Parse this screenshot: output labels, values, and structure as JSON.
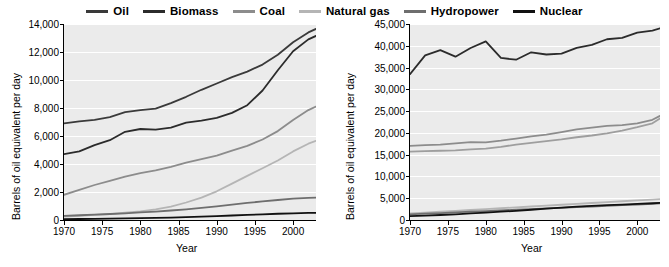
{
  "legend": {
    "items": [
      {
        "label": "Oil",
        "color": "#3a3a3a"
      },
      {
        "label": "Biomass",
        "color": "#2b2b2b"
      },
      {
        "label": "Coal",
        "color": "#8c8c8c"
      },
      {
        "label": "Natural gas",
        "color": "#b5b5b5"
      },
      {
        "label": "Hydropower",
        "color": "#6e6e6e"
      },
      {
        "label": "Nuclear",
        "color": "#111111"
      }
    ]
  },
  "chart_data": [
    {
      "type": "line",
      "title": "",
      "xlabel": "Year",
      "ylabel": "Barrels of oil equivalent per day",
      "xlim": [
        1970,
        2003
      ],
      "ylim": [
        0,
        14000
      ],
      "xticks": [
        1970,
        1975,
        1980,
        1985,
        1990,
        1995,
        2000
      ],
      "yticks": [
        0,
        2000,
        4000,
        6000,
        8000,
        10000,
        12000,
        14000
      ],
      "ytick_labels": [
        "0",
        "2,000",
        "4,000",
        "6,000",
        "8,000",
        "10,000",
        "12,000",
        "14,000"
      ],
      "grid": true,
      "legend_position": "top",
      "x": [
        1970,
        1972,
        1974,
        1976,
        1978,
        1980,
        1982,
        1984,
        1986,
        1988,
        1990,
        1992,
        1994,
        1996,
        1998,
        2000,
        2002,
        2003
      ],
      "series": [
        {
          "name": "Oil",
          "color": "#3a3a3a",
          "values": [
            6900,
            7050,
            7150,
            7350,
            7700,
            7850,
            7950,
            8350,
            8800,
            9300,
            9750,
            10200,
            10600,
            11100,
            11800,
            12700,
            13400,
            13650
          ]
        },
        {
          "name": "Biomass",
          "color": "#2b2b2b",
          "values": [
            4700,
            4900,
            5350,
            5700,
            6300,
            6500,
            6450,
            6600,
            6950,
            7100,
            7300,
            7650,
            8200,
            9250,
            10700,
            12050,
            12900,
            13150
          ]
        },
        {
          "name": "Coal",
          "color": "#8c8c8c",
          "values": [
            1800,
            2150,
            2500,
            2800,
            3100,
            3350,
            3550,
            3800,
            4100,
            4350,
            4600,
            4950,
            5300,
            5750,
            6350,
            7150,
            7850,
            8100
          ]
        },
        {
          "name": "Natural gas",
          "color": "#b5b5b5",
          "values": [
            250,
            300,
            360,
            420,
            520,
            620,
            760,
            950,
            1250,
            1600,
            2050,
            2600,
            3150,
            3700,
            4250,
            4900,
            5450,
            5650
          ]
        },
        {
          "name": "Hydropower",
          "color": "#6e6e6e",
          "values": [
            300,
            340,
            380,
            430,
            480,
            540,
            600,
            680,
            760,
            860,
            980,
            1100,
            1220,
            1330,
            1430,
            1520,
            1580,
            1600
          ]
        },
        {
          "name": "Nuclear",
          "color": "#111111",
          "values": [
            60,
            70,
            80,
            95,
            110,
            130,
            150,
            175,
            205,
            240,
            280,
            320,
            365,
            405,
            445,
            480,
            505,
            515
          ]
        }
      ]
    },
    {
      "type": "line",
      "title": "",
      "xlabel": "Year",
      "ylabel": "Barrels of oil equivalent per day",
      "xlim": [
        1970,
        2003
      ],
      "ylim": [
        0,
        45000
      ],
      "xticks": [
        1970,
        1975,
        1980,
        1985,
        1990,
        1995,
        2000
      ],
      "yticks": [
        0,
        5000,
        10000,
        15000,
        20000,
        25000,
        30000,
        35000,
        40000,
        45000
      ],
      "ytick_labels": [
        "0",
        "5,000",
        "10,000",
        "15,000",
        "20,000",
        "25,000",
        "30,000",
        "35,000",
        "40,000",
        "45,000"
      ],
      "grid": true,
      "legend_position": "top",
      "x": [
        1970,
        1972,
        1974,
        1976,
        1978,
        1980,
        1982,
        1984,
        1986,
        1988,
        1990,
        1992,
        1994,
        1996,
        1998,
        2000,
        2002,
        2003
      ],
      "series": [
        {
          "name": "Oil",
          "color": "#2b2b2b",
          "values": [
            33500,
            37800,
            39000,
            37500,
            39500,
            41000,
            37200,
            36800,
            38500,
            38000,
            38200,
            39500,
            40200,
            41500,
            41800,
            43000,
            43500,
            44000
          ]
        },
        {
          "name": "Biomass",
          "color": "#8c8c8c",
          "values": [
            17000,
            17200,
            17300,
            17600,
            17900,
            17800,
            18200,
            18700,
            19200,
            19600,
            20200,
            20800,
            21200,
            21600,
            21800,
            22200,
            23000,
            23900
          ]
        },
        {
          "name": "Coal",
          "color": "#9e9e9e",
          "values": [
            15700,
            15800,
            15900,
            16000,
            16200,
            16400,
            16800,
            17300,
            17700,
            18100,
            18500,
            19000,
            19400,
            19900,
            20500,
            21300,
            22200,
            23300
          ]
        },
        {
          "name": "Natural gas",
          "color": "#b5b5b5",
          "values": [
            1500,
            1700,
            1900,
            2100,
            2300,
            2500,
            2700,
            2900,
            3100,
            3300,
            3500,
            3700,
            3900,
            4100,
            4300,
            4500,
            4700,
            4800
          ]
        },
        {
          "name": "Hydropower",
          "color": "#6e6e6e",
          "values": [
            1300,
            1450,
            1600,
            1750,
            1900,
            2050,
            2200,
            2350,
            2500,
            2650,
            2800,
            2950,
            3100,
            3250,
            3400,
            3550,
            3700,
            3800
          ]
        },
        {
          "name": "Nuclear",
          "color": "#111111",
          "values": [
            900,
            1000,
            1150,
            1300,
            1500,
            1700,
            1900,
            2100,
            2350,
            2600,
            2850,
            3050,
            3250,
            3400,
            3550,
            3700,
            3850,
            3950
          ]
        }
      ]
    }
  ]
}
